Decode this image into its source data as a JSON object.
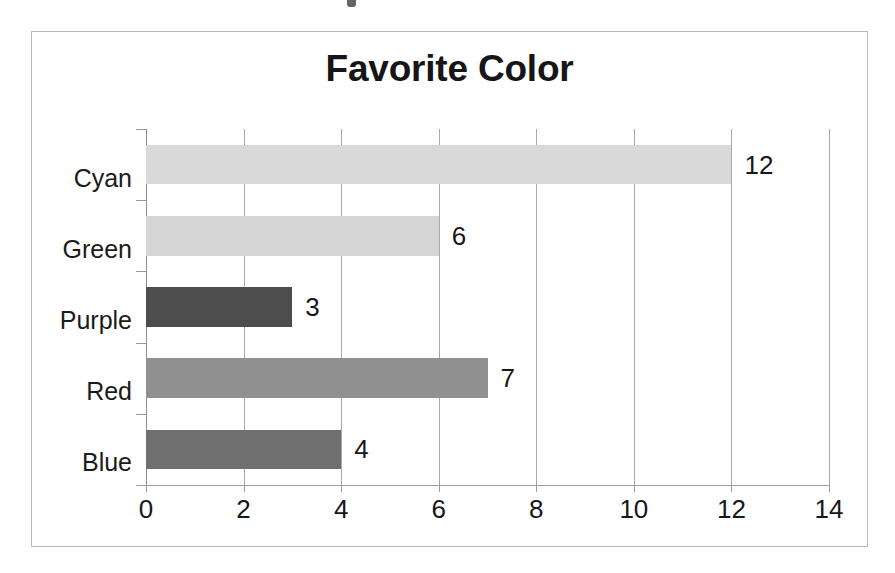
{
  "chart_data": {
    "type": "bar",
    "orientation": "horizontal",
    "title": "Favorite Color",
    "xlabel": "",
    "ylabel": "",
    "categories": [
      "Cyan",
      "Green",
      "Purple",
      "Red",
      "Blue"
    ],
    "values": [
      12,
      6,
      3,
      7,
      4
    ],
    "data_labels": [
      "12",
      "6",
      "3",
      "7",
      "4"
    ],
    "bar_colors": [
      "#d9d9d9",
      "#d6d6d6",
      "#4d4d4d",
      "#909090",
      "#6f6f6f"
    ],
    "xlim": [
      0,
      14
    ],
    "xticks": [
      0,
      2,
      4,
      6,
      8,
      10,
      12,
      14
    ],
    "xtick_labels": [
      "0",
      "2",
      "4",
      "6",
      "8",
      "10",
      "12",
      "14"
    ],
    "grid": "vertical",
    "legend": "none",
    "plot_background": "#ffffff",
    "gridline_color": "#a9a9a9",
    "border_color": "#b9b9b9",
    "title_color": "#161616"
  }
}
